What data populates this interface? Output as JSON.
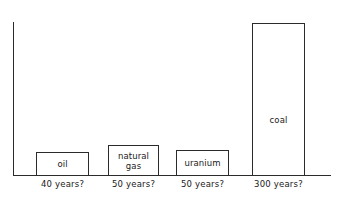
{
  "chart_data": {
    "type": "bar",
    "title": "",
    "subtitle": "",
    "xlabel": "",
    "ylabel": "",
    "grid": false,
    "legend": "none",
    "axis_style": "open-l-shape",
    "ylim": [
      0,
      330
    ],
    "categories": [
      "oil",
      "natural\ngas",
      "uranium",
      "coal"
    ],
    "values": [
      40,
      50,
      50,
      300
    ],
    "unit": "years",
    "bars": [
      {
        "id": "oil",
        "label": "oil",
        "value": 40,
        "tick_label": "40 years?",
        "label_position": "inside-center"
      },
      {
        "id": "natural-gas",
        "label": "natural\ngas",
        "value": 50,
        "tick_label": "50 years?",
        "label_position": "inside-center"
      },
      {
        "id": "uranium",
        "label": "uranium",
        "value": 50,
        "tick_label": "50 years?",
        "label_position": "inside-center"
      },
      {
        "id": "coal",
        "label": "coal",
        "value": 300,
        "tick_label": "300 years?",
        "label_position": "inside-middle"
      }
    ],
    "colors": {
      "background": "#ffffff",
      "bar_fill": "#ffffff",
      "bar_stroke": "#2b2b2b",
      "axis": "#2b2b2b",
      "text": "#1a1a1a"
    }
  }
}
